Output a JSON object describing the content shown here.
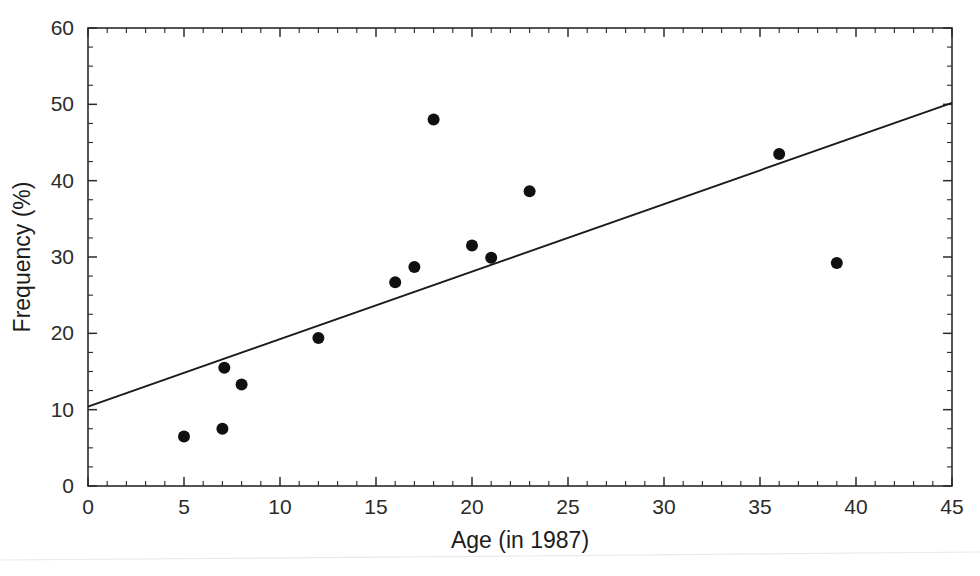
{
  "chart_data": {
    "type": "scatter",
    "title": "",
    "subtitle": "",
    "xlabel": "Age (in 1987)",
    "ylabel": "Frequency (%)",
    "xlim": [
      0,
      45
    ],
    "ylim": [
      0,
      60
    ],
    "x_ticks": [
      0,
      5,
      10,
      15,
      20,
      25,
      30,
      35,
      40,
      45
    ],
    "y_ticks": [
      0,
      10,
      20,
      30,
      40,
      50,
      60
    ],
    "x_tick_labels": [
      "0",
      "5",
      "10",
      "15",
      "20",
      "25",
      "30",
      "35",
      "40",
      "45"
    ],
    "y_tick_labels": [
      "0",
      "10",
      "20",
      "30",
      "40",
      "50",
      "60"
    ],
    "x_minor_step": 1,
    "y_minor_step": 2.5,
    "grid": false,
    "legend": false,
    "legend_position": "none",
    "point_color": "#101010",
    "line_color": "#1a1a1a",
    "axis_color": "#2a2a2a",
    "marker": "filled-circle",
    "marker_radius": 6,
    "series": [
      {
        "name": "Observations",
        "points": [
          {
            "x": 5.0,
            "y": 6.5
          },
          {
            "x": 7.0,
            "y": 7.5
          },
          {
            "x": 7.1,
            "y": 15.5
          },
          {
            "x": 8.0,
            "y": 13.3
          },
          {
            "x": 12.0,
            "y": 19.4
          },
          {
            "x": 16.0,
            "y": 26.7
          },
          {
            "x": 17.0,
            "y": 28.7
          },
          {
            "x": 18.0,
            "y": 48.0
          },
          {
            "x": 20.0,
            "y": 31.5
          },
          {
            "x": 21.0,
            "y": 29.9
          },
          {
            "x": 23.0,
            "y": 38.6
          },
          {
            "x": 36.0,
            "y": 43.5
          },
          {
            "x": 39.0,
            "y": 29.2
          }
        ]
      }
    ],
    "trend_line": {
      "name": "Linear fit",
      "x_start": 0,
      "y_start": 10.4,
      "x_end": 45,
      "y_end": 50.2
    }
  }
}
